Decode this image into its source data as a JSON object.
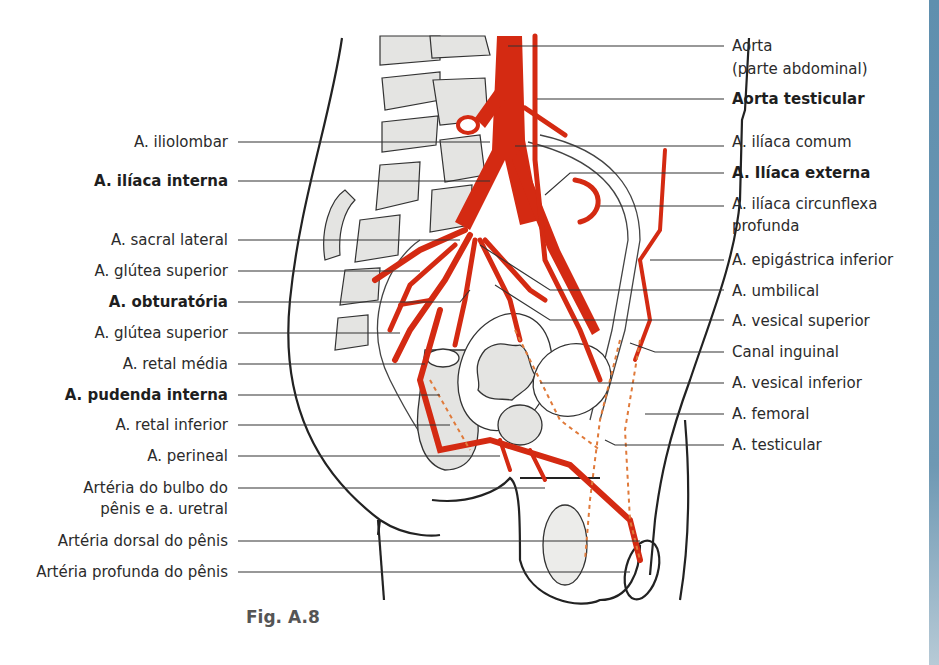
{
  "figure": {
    "caption": "Fig. A.8",
    "accent_color": "#d42a12",
    "structure_fill": "#e4e4e2",
    "outline_color": "#222222",
    "side_strip_color": "#6a95b2"
  },
  "labels_left": [
    {
      "text": "A. iliolombar",
      "bold": false,
      "y": 142
    },
    {
      "text": "A. ilíaca interna",
      "bold": true,
      "y": 181
    },
    {
      "text": "A. sacral lateral",
      "bold": false,
      "y": 240
    },
    {
      "text": "A. glútea superior",
      "bold": false,
      "y": 271
    },
    {
      "text": "A. obturatória",
      "bold": true,
      "y": 302
    },
    {
      "text": "A. glútea superior",
      "bold": false,
      "y": 333
    },
    {
      "text": "A. retal média",
      "bold": false,
      "y": 364
    },
    {
      "text": "A. pudenda interna",
      "bold": true,
      "y": 395
    },
    {
      "text": "A. retal inferior",
      "bold": false,
      "y": 425
    },
    {
      "text": "A. perineal",
      "bold": false,
      "y": 456
    },
    {
      "text": "Artéria do bulbo do",
      "bold": false,
      "y": 488
    },
    {
      "text": "pênis e a. uretral",
      "bold": false,
      "y": 509
    },
    {
      "text": "Artéria dorsal do pênis",
      "bold": false,
      "y": 541
    },
    {
      "text": "Artéria profunda do pênis",
      "bold": false,
      "y": 572
    }
  ],
  "labels_right": [
    {
      "text": "Aorta",
      "bold": false,
      "y": 46
    },
    {
      "text": "(parte abdominal)",
      "bold": false,
      "y": 69
    },
    {
      "text": "Aorta testicular",
      "bold": true,
      "y": 99
    },
    {
      "text": "A. ilíaca comum",
      "bold": false,
      "y": 142
    },
    {
      "text": "A. Ilíaca externa",
      "bold": true,
      "y": 173
    },
    {
      "text": "A. ilíaca circunflexa",
      "bold": false,
      "y": 204
    },
    {
      "text": "profunda",
      "bold": false,
      "y": 226
    },
    {
      "text": "A. epigástrica inferior",
      "bold": false,
      "y": 260
    },
    {
      "text": "A. umbilical",
      "bold": false,
      "y": 291
    },
    {
      "text": "A. vesical superior",
      "bold": false,
      "y": 321
    },
    {
      "text": "Canal inguinal",
      "bold": false,
      "y": 352
    },
    {
      "text": "A. vesical inferior",
      "bold": false,
      "y": 383
    },
    {
      "text": "A. femoral",
      "bold": false,
      "y": 414
    },
    {
      "text": "A. testicular",
      "bold": false,
      "y": 445
    }
  ]
}
